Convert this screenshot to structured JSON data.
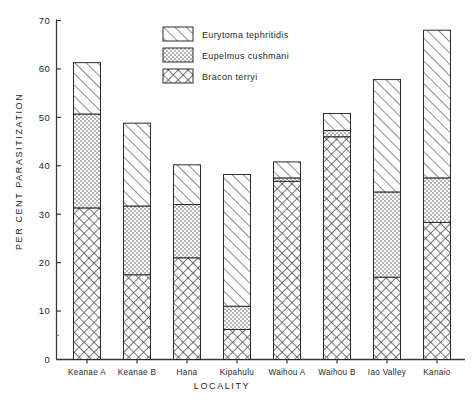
{
  "chart_data": {
    "type": "bar",
    "stacked": true,
    "title": "",
    "xlabel": "LOCALITY",
    "ylabel": "PER CENT PARASITIZATION",
    "ylim": [
      0,
      70
    ],
    "ytick_step": 10,
    "yticks": [
      0,
      10,
      20,
      30,
      40,
      50,
      60,
      70
    ],
    "ytick_labels": [
      "0",
      "10",
      "20",
      "30",
      "40",
      "50",
      "60",
      "70"
    ],
    "grid": false,
    "legend_position": "upper center",
    "categories": [
      "Keanae  A",
      "Keanae  B",
      "Hana",
      "Kipahulu",
      "Waihou  A",
      "Waihou  B",
      "Iao Valley",
      "Kanaio"
    ],
    "series": [
      {
        "name": "Bracon terryi",
        "pattern": "cross-hatch",
        "values": [
          31.3,
          17.5,
          21.0,
          6.2,
          36.8,
          46.0,
          17.0,
          28.3
        ]
      },
      {
        "name": "Eupelmus cushmani",
        "pattern": "stipple",
        "values": [
          19.4,
          14.2,
          11.0,
          4.8,
          0.7,
          1.3,
          17.6,
          9.2
        ]
      },
      {
        "name": "Eurytoma tephritidis",
        "pattern": "diagonal-hatch",
        "values": [
          10.6,
          17.1,
          8.2,
          27.2,
          3.3,
          3.5,
          23.2,
          30.5
        ]
      }
    ],
    "totals": [
      61.3,
      48.8,
      40.2,
      38.2,
      40.8,
      50.8,
      57.8,
      68.0
    ],
    "legend": [
      {
        "label": "Eurytoma tephritidis",
        "pattern": "diagonal-hatch"
      },
      {
        "label": "Eupelmus cushmani",
        "pattern": "stipple"
      },
      {
        "label": "Bracon terryi",
        "pattern": "cross-hatch"
      }
    ]
  },
  "colors": {
    "axis": "#3a3a3a",
    "ink": "#1f1f1f",
    "background": "#ffffff",
    "pattern_fill": "#f0f0f0"
  }
}
